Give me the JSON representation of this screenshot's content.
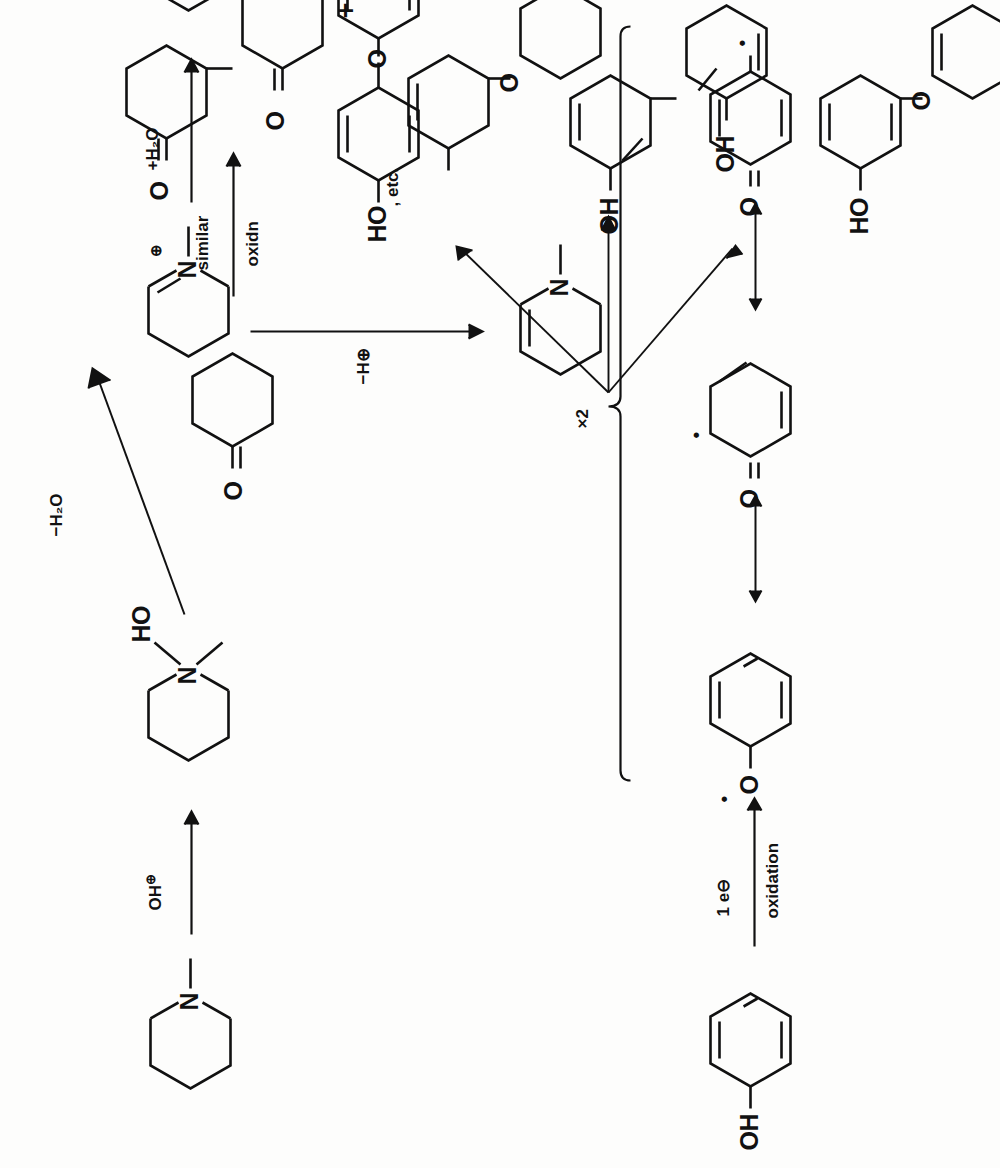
{
  "document": {
    "type": "organic-chemistry-reaction-scheme",
    "orientation": "rotated-90-ccw",
    "ink_color": "#111111",
    "paper_color": "#fdfdfc"
  },
  "scheme_a": {
    "name": "phenol-oxidative-coupling",
    "reactant": {
      "name": "phenol",
      "oh_label": "OH"
    },
    "arrow_label_top": "1 e⊖",
    "arrow_label_bottom": "oxidation",
    "resonance": {
      "arrow_glyph": "↔",
      "structures": [
        {
          "name": "phenoxyl-radical-O-centered",
          "o_label": "O",
          "radical_dot": "•",
          "radical_site": "oxygen"
        },
        {
          "name": "cyclohexadienone-ortho-radical",
          "o_label": "O",
          "radical_dot": "•",
          "radical_site": "ortho"
        },
        {
          "name": "cyclohexadienone-para-radical",
          "o_label": "O",
          "radical_dot": "•",
          "radical_site": "para"
        }
      ]
    },
    "bracket": {
      "multiplier": "×2"
    },
    "products": [
      {
        "name": "4-phenoxyphenol",
        "labels": [
          "HO",
          "O"
        ],
        "trailing": ", etc."
      },
      {
        "name": "2,2'-biphenol",
        "labels": [
          "OH",
          "OH"
        ]
      },
      {
        "name": "2-phenoxyphenol",
        "labels": [
          "HO",
          "O"
        ]
      }
    ]
  },
  "scheme_b": {
    "name": "cyclohexanone-oxidative-coupling",
    "reactant": {
      "name": "cyclohexanone",
      "o_label": "O"
    },
    "arrow_label_top": "similar",
    "arrow_label_bottom": "oxidn",
    "plus": "+",
    "products": [
      {
        "name": "2,2'-bicyclohexanone",
        "labels": [
          "O",
          "O"
        ]
      },
      {
        "name": "2-(cyclohexenyloxy)cyclohexanone",
        "labels": [
          "O",
          "O"
        ],
        "trailing": ", etc."
      }
    ]
  },
  "scheme_c": {
    "name": "n-methylpiperidine-oxidation",
    "reactant": {
      "name": "N-methylpiperidine",
      "n_label": "N"
    },
    "reagent": {
      "text": "OH",
      "charge": "⊕"
    },
    "intermediate_1": {
      "name": "N-hydroxy-N-methylpiperidinium",
      "n_label": "N",
      "oh_label": "HO"
    },
    "step_minus_water": {
      "label": "−H₂O"
    },
    "iminium": {
      "name": "N-methyl-iminium-ion",
      "n_label": "N",
      "charge": "⊕"
    },
    "step_add_water": {
      "label": "+H₂O"
    },
    "carbinolamine": {
      "name": "2-hydroxy-N-methylpiperidine",
      "n_label": "N",
      "oh_label": "HO"
    },
    "step_minus_proton": {
      "label": "−H⊕"
    },
    "enamine": {
      "name": "N-methyl-tetrahydropyridine-enamine",
      "n_label": "N"
    }
  }
}
